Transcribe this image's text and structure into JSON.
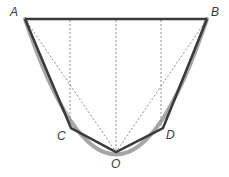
{
  "diagram": {
    "colors": {
      "curve": "#a6a6a6",
      "polygon": "#3a3a3a",
      "dashed": "#8c8c8c",
      "label": "#3a3a3a"
    },
    "points": {
      "A": {
        "label": "A",
        "x": 25,
        "y": 19
      },
      "B": {
        "label": "B",
        "x": 207,
        "y": 19
      },
      "C": {
        "label": "C",
        "x": 71,
        "y": 128
      },
      "O": {
        "label": "O",
        "x": 116,
        "y": 152
      },
      "D": {
        "label": "D",
        "x": 163,
        "y": 128
      }
    },
    "labels": {
      "A": "A",
      "B": "B",
      "C": "C",
      "D": "D",
      "O": "O"
    }
  }
}
